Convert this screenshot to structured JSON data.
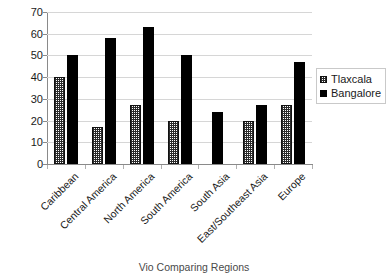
{
  "chart_data": {
    "type": "bar",
    "title": "",
    "xlabel": "Vio Comparing Regions",
    "ylabel": "",
    "ylim": [
      0,
      70
    ],
    "yticks": [
      0,
      10,
      20,
      30,
      40,
      50,
      60,
      70
    ],
    "grid": true,
    "legend_position": "right",
    "categories": [
      "Caribbean",
      "Central America",
      "North America",
      "South America",
      "South Asia",
      "East/Southeast Asia",
      "Europe"
    ],
    "series": [
      {
        "name": "Tlaxcala",
        "color": "#ffffff",
        "pattern": "checkerboard",
        "values": [
          40,
          17,
          27,
          20,
          null,
          20,
          27
        ]
      },
      {
        "name": "Bangalore",
        "color": "#000000",
        "pattern": "solid",
        "values": [
          50,
          58,
          63,
          50,
          24,
          27,
          47
        ]
      }
    ]
  },
  "legend": {
    "items": [
      {
        "label": "Tlaxcala"
      },
      {
        "label": "Bangalore"
      }
    ]
  },
  "axis": {
    "y_tick_labels": [
      "70",
      "60",
      "50",
      "40",
      "30",
      "20",
      "10",
      "0"
    ],
    "x_title": "Vio Comparing Regions"
  }
}
